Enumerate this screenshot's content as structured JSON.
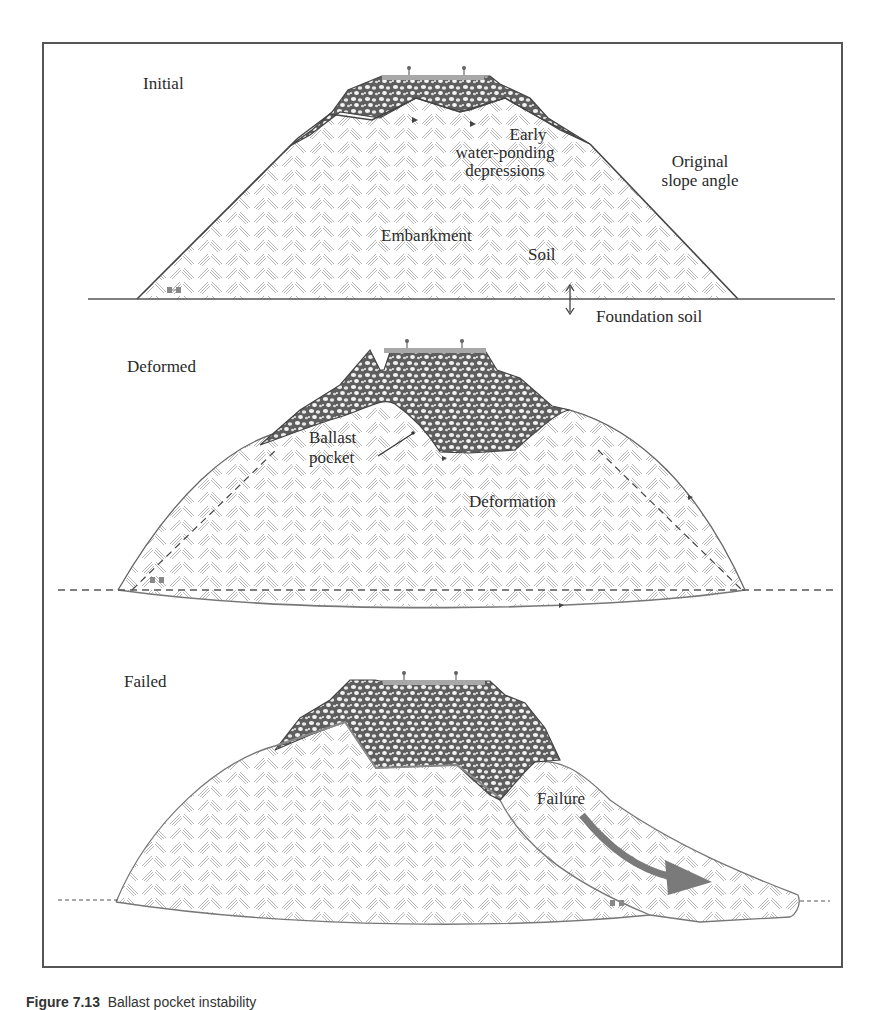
{
  "figure": {
    "caption_number": "Figure 7.13",
    "caption_text": "Ballast pocket instability"
  },
  "panels": [
    {
      "title": "Initial",
      "labels": {
        "depressions_line1": "Early",
        "depressions_line2": "water-ponding",
        "depressions_line3": "depressions",
        "slope_line1": "Original",
        "slope_line2": "slope angle",
        "embankment": "Embankment",
        "soil": "Soil",
        "foundation": "Foundation soil"
      }
    },
    {
      "title": "Deformed",
      "labels": {
        "pocket_line1": "Ballast",
        "pocket_line2": "pocket",
        "deformation": "Deformation"
      }
    },
    {
      "title": "Failed",
      "labels": {
        "failure": "Failure"
      }
    }
  ],
  "colors": {
    "frame": "#555555",
    "outline": "#555555",
    "ballast_fill": "#6f6f6f",
    "sleeper": "#a8a8a8",
    "soil_hatch": "#b5b5b5",
    "failure_arrow": "#7a7a7a"
  }
}
